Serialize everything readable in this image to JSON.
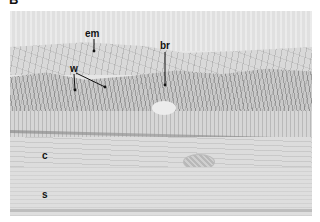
{
  "figure": {
    "panel_label": "B",
    "labels": {
      "em": "em",
      "br": "br",
      "w": "w",
      "c": "c",
      "s": "s"
    },
    "colors": {
      "background": "#ffffff",
      "tissue_light": "#e4e4e4",
      "tissue_mid": "#c9c9c9",
      "label_text": "#111111"
    }
  }
}
